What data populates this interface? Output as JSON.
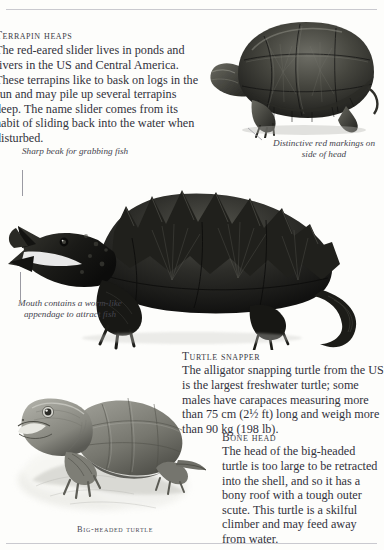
{
  "page": {
    "background": "#fdfdfb",
    "text_color": "#32323c",
    "rules": [
      "top-rule",
      "bottom-rule"
    ]
  },
  "sections": {
    "terrapin_heaps": {
      "heading": "Terrapin heaps",
      "body": "The red-eared slider lives in ponds and rivers in the US and Central America. These terrapins like to bask on logs in the sun and may pile up several terrapins deep. The name slider comes from its habit of sliding back into the water when disturbed."
    },
    "turtle_snapper": {
      "heading": "Turtle snapper",
      "body": "The alligator snapping turtle from the US is the largest freshwater turtle; some males have carapaces measuring more than 75 cm (2½ ft) long and weigh more than 90 kg (198 lb)."
    },
    "bone_head": {
      "heading": "Bone head",
      "body": "The head of the big-headed turtle is too large to be retracted into the shell, and so it has a bony roof with a tough outer scute. This turtle is a skilful climber and may feed away from water."
    }
  },
  "captions": {
    "sharp_beak": "Sharp beak for grabbing fish",
    "mouth_appendage": "Mouth contains a worm-like appendage to attract fish",
    "red_markings": "Distinctive red markings on side of head",
    "bigheaded_label": "Big-headed turtle"
  },
  "figures": {
    "slider": {
      "name": "red-eared-slider-photo",
      "shell_color": "#4a4a46",
      "shell_dark": "#232320",
      "skin_color": "#5d5d56"
    },
    "snapper": {
      "name": "alligator-snapping-turtle-photo",
      "body_color": "#1d1d1b",
      "highlight_color": "#5a5a54",
      "shell_ridge_color": "#3b3b36"
    },
    "bighead": {
      "name": "big-headed-turtle-illustration",
      "body_color": "#8b8b84",
      "shell_color": "#76766f",
      "rock_color": "#cfcfc9",
      "spray_color": "#f2f2ee"
    }
  }
}
